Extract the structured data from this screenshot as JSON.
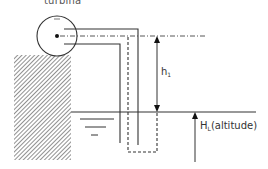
{
  "diagram": {
    "labels": {
      "turbine": "turbina",
      "head_symbol": "h",
      "head_subscript": "1",
      "altitude_symbol": "H",
      "altitude_subscript": "L",
      "altitude_text": "(altitude)"
    },
    "elements": [
      "turbine (circle with center dot)",
      "horizontal pipe from turbine",
      "vertical pipe walls descending into water",
      "dashed line showing water column",
      "dash-dot centerline at turbine axis",
      "hatched ground block",
      "water surface line with surface symbol",
      "double-headed arrow h1 between turbine axis and water surface",
      "upward arrow H_L from below to water surface"
    ],
    "colors": {
      "stroke": "#333333",
      "hatch": "#555555",
      "background": "#ffffff"
    }
  }
}
